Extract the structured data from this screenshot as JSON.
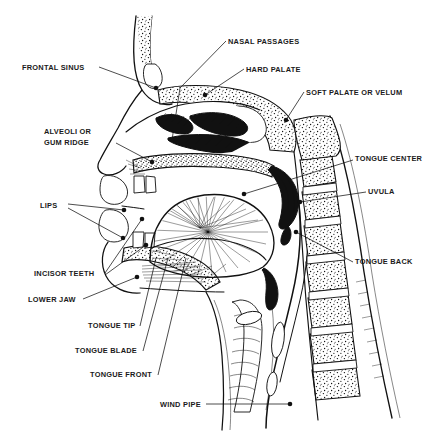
{
  "figure": {
    "background_color": "#ffffff",
    "ink_color": "#111111",
    "width": 441,
    "height": 432
  },
  "labels": [
    {
      "id": "nasal-passages",
      "text": "NASAL PASSAGES",
      "x": 228,
      "y": 44,
      "anchor": "start"
    },
    {
      "id": "hard-palate",
      "text": "HARD PALATE",
      "x": 246,
      "y": 72,
      "anchor": "start"
    },
    {
      "id": "soft-palate",
      "text": "SOFT PALATE OR VELUM",
      "x": 306,
      "y": 95,
      "anchor": "start"
    },
    {
      "id": "frontal-sinus",
      "text": "FRONTAL SINUS",
      "x": 22,
      "y": 70,
      "anchor": "start"
    },
    {
      "id": "alveoli-line1",
      "text": "ALVEOLI OR",
      "x": 44,
      "y": 134,
      "anchor": "start"
    },
    {
      "id": "alveoli-line2",
      "text": "GUM RIDGE",
      "x": 44,
      "y": 145,
      "anchor": "start"
    },
    {
      "id": "tongue-center",
      "text": "TONGUE CENTER",
      "x": 355,
      "y": 161,
      "anchor": "start"
    },
    {
      "id": "uvula",
      "text": "UVULA",
      "x": 368,
      "y": 194,
      "anchor": "start"
    },
    {
      "id": "lips",
      "text": "LIPS",
      "x": 40,
      "y": 208,
      "anchor": "start"
    },
    {
      "id": "tongue-back",
      "text": "TONGUE BACK",
      "x": 355,
      "y": 264,
      "anchor": "start"
    },
    {
      "id": "incisor-teeth",
      "text": "INCISOR TEETH",
      "x": 34,
      "y": 276,
      "anchor": "start"
    },
    {
      "id": "lower-jaw",
      "text": "LOWER JAW",
      "x": 28,
      "y": 302,
      "anchor": "start"
    },
    {
      "id": "tongue-tip",
      "text": "TONGUE TIP",
      "x": 88,
      "y": 328,
      "anchor": "start"
    },
    {
      "id": "tongue-blade",
      "text": "TONGUE BLADE",
      "x": 75,
      "y": 353,
      "anchor": "start"
    },
    {
      "id": "tongue-front",
      "text": "TONGUE FRONT",
      "x": 90,
      "y": 377,
      "anchor": "start"
    },
    {
      "id": "wind-pipe",
      "text": "WIND PIPE",
      "x": 160,
      "y": 407,
      "anchor": "start"
    }
  ],
  "leaders": [
    {
      "id": "leader-nasal-passages",
      "path": "M 226 41 L 180 88 L 172 140",
      "dots": [
        [
          172,
          140
        ]
      ]
    },
    {
      "id": "leader-hard-palate",
      "path": "M 244 69 L 205 95",
      "dots": [
        [
          205,
          95
        ]
      ]
    },
    {
      "id": "leader-soft-palate",
      "path": "M 304 92 L 286 120",
      "dots": [
        [
          286,
          120
        ]
      ]
    },
    {
      "id": "leader-frontal-sinus",
      "path": "M 99 67 L 156 88",
      "dots": [
        [
          156,
          88
        ]
      ]
    },
    {
      "id": "leader-alveoli",
      "path": "M 116 143 L 152 162",
      "dots": [
        [
          152,
          162
        ]
      ]
    },
    {
      "id": "leader-tongue-center",
      "path": "M 353 160 L 244 194",
      "dots": [
        [
          244,
          194
        ]
      ]
    },
    {
      "id": "leader-uvula",
      "path": "M 366 192 L 300 202",
      "dots": [
        [
          300,
          202
        ]
      ]
    },
    {
      "id": "leader-lips-upper",
      "path": "M 68 204 L 124 210",
      "dots": [
        [
          124,
          210
        ]
      ]
    },
    {
      "id": "leader-lips-lower",
      "path": "M 68 208 L 123 238",
      "dots": [
        [
          123,
          238
        ]
      ]
    },
    {
      "id": "leader-tongue-back",
      "path": "M 353 262 L 296 232",
      "dots": [
        [
          296,
          232
        ]
      ]
    },
    {
      "id": "leader-incisor-upper",
      "path": "M 105 273 L 142 219",
      "dots": [
        [
          142,
          219
        ]
      ]
    },
    {
      "id": "leader-incisor-lower",
      "path": "M 105 275 L 146 245",
      "dots": [
        [
          146,
          245
        ]
      ]
    },
    {
      "id": "leader-lower-jaw",
      "path": "M 83 299 L 137 277",
      "dots": [
        [
          137,
          277
        ]
      ]
    },
    {
      "id": "leader-tongue-tip",
      "path": "M 140 326 L 156 258",
      "dots": []
    },
    {
      "id": "leader-tongue-blade",
      "path": "M 143 351 L 168 258",
      "dots": []
    },
    {
      "id": "leader-tongue-front",
      "path": "M 158 375 L 186 258",
      "dots": []
    },
    {
      "id": "leader-wind-pipe",
      "path": "M 206 404 L 290 404",
      "dots": [
        [
          290,
          404
        ]
      ]
    }
  ],
  "anatomy_parts": [
    "frontal-bone",
    "frontal-sinus-cavity",
    "nasal-cavity",
    "turbinates",
    "hard-palate",
    "soft-palate",
    "uvula",
    "upper-lip",
    "lower-lip",
    "upper-incisors",
    "lower-incisors",
    "mandible",
    "tongue-body",
    "oropharynx",
    "epiglottis",
    "larynx",
    "trachea",
    "esophagus",
    "cervical-vertebrae",
    "spinal-cord",
    "neck-profile"
  ]
}
